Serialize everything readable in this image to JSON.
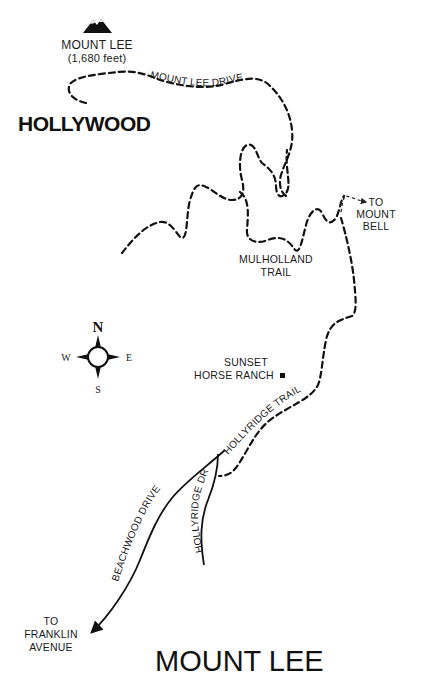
{
  "map": {
    "title": "MOUNT LEE",
    "peak": {
      "name": "MOUNT LEE",
      "elevation": "(1,680 feet)",
      "icon": "mountain-peak-icon"
    },
    "landmark": "HOLLYWOOD",
    "roads": {
      "mount_lee_drive": "MOUNT LEE DRIVE",
      "mulholland_trail_line1": "MULHOLLAND",
      "mulholland_trail_line2": "TRAIL",
      "hollyridge_trail": "HOLLYRIDGE TRAIL",
      "beachwood_drive": "BEACHWOOD DRIVE",
      "hollyridge_dr": "HOLLYRIDGE DR"
    },
    "destinations": {
      "mount_bell": [
        "TO",
        "MOUNT",
        "BELL"
      ],
      "franklin_avenue": [
        "TO",
        "FRANKLIN",
        "AVENUE"
      ]
    },
    "points_of_interest": {
      "ranch_line1": "SUNSET",
      "ranch_line2": "HORSE RANCH"
    },
    "compass": {
      "n": "N",
      "s": "S",
      "e": "E",
      "w": "W"
    },
    "colors": {
      "ink": "#111111",
      "background": "#ffffff"
    }
  }
}
